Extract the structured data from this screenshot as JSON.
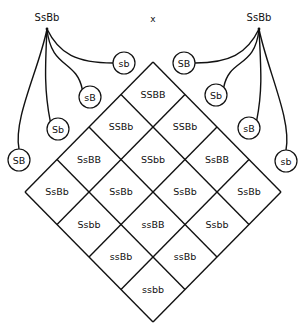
{
  "cross_symbol": "x",
  "parents": {
    "left": {
      "genotype": "SsBb",
      "gametes": [
        "SB",
        "Sb",
        "sB",
        "sb"
      ]
    },
    "right": {
      "genotype": "SsBb",
      "gametes": [
        "SB",
        "Sb",
        "sB",
        "sb"
      ]
    }
  },
  "grid": {
    "rows": [
      [
        "SSBB",
        "SSBb",
        "SsBB",
        "SsBb"
      ],
      [
        "SSBb",
        "SSbb",
        "SsBb",
        "Ssbb"
      ],
      [
        "SsBB",
        "SsBb",
        "ssBB",
        "ssBb"
      ],
      [
        "SsBb",
        "Ssbb",
        "ssBb",
        "ssbb"
      ]
    ]
  }
}
